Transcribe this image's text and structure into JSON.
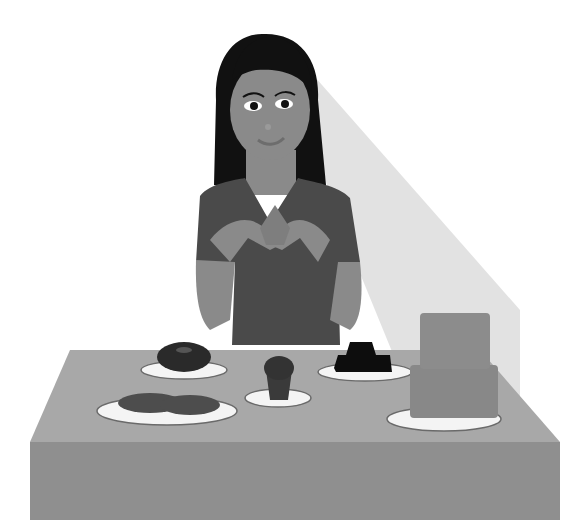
{
  "scene": {
    "description": "Grayscale illustration of a woman with long dark hair seated behind a table of desserts",
    "colors": {
      "background": "#ffffff",
      "shadow": "#d9d9d9",
      "hair": "#111111",
      "skin": "#8a8a8a",
      "shirt": "#4a4a4a",
      "table_top": "#a8a8a8",
      "table_front": "#8f8f8f",
      "plate": "#f4f4f4",
      "plate_rim": "#6a6a6a",
      "donut": "#2a2a2a",
      "cupcake": "#3a3a3a",
      "brownies": "#0d0d0d",
      "cookies": "#4d4d4d",
      "cake": "#888888"
    },
    "items": [
      {
        "name": "donut"
      },
      {
        "name": "cupcake"
      },
      {
        "name": "brownies"
      },
      {
        "name": "cookies"
      },
      {
        "name": "two-tier cake"
      }
    ]
  }
}
